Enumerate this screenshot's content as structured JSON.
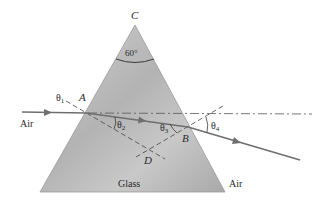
{
  "figure": {
    "apex_angle_label": "60°",
    "vertex_labels": {
      "apex": "C",
      "entry_point": "A",
      "exit_point": "B",
      "normals_intersection": "D"
    },
    "angle_labels": {
      "theta1": "θ1",
      "theta2": "θ2",
      "theta3": "θ3",
      "theta4": "θ4"
    },
    "angle_parts": {
      "theta": "θ",
      "sub1": "1",
      "sub2": "2",
      "sub3": "3",
      "sub4": "4"
    },
    "region_labels": {
      "air_left": "Air",
      "glass": "Glass",
      "air_right": "Air"
    },
    "colors": {
      "prism_fill": "#bdbdbd",
      "prism_edge": "#9a9a9a",
      "ray": "#6e6e6e",
      "dashed_lines": "#555555",
      "text": "#2a2a2a"
    }
  }
}
